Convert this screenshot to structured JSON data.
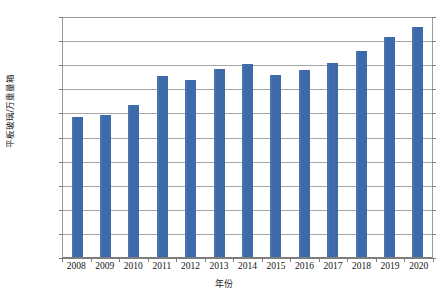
{
  "chart_data": {
    "type": "bar",
    "title": "",
    "xlabel": "年份",
    "ylabel": "平板玻璃/万重量箱",
    "categories": [
      "2008",
      "2009",
      "2010",
      "2011",
      "2012",
      "2013",
      "2014",
      "2015",
      "2016",
      "2017",
      "2018",
      "2019",
      "2020"
    ],
    "values": [
      58000,
      59000,
      63000,
      75000,
      73500,
      78000,
      80000,
      75500,
      77500,
      80500,
      85500,
      91500,
      95500
    ],
    "ylim": [
      0,
      100000
    ],
    "yticks": [
      0,
      10000,
      20000,
      30000,
      40000,
      50000,
      60000,
      70000,
      80000,
      90000,
      100000
    ],
    "ytick_labels": [
      "0",
      "10000",
      "20000",
      "30000",
      "40000",
      "50000",
      "60000",
      "70000",
      "80000",
      "90000",
      "100000"
    ],
    "grid": true,
    "legend": false,
    "legend_position": "none",
    "series": [
      {
        "name": "平板玻璃产量",
        "color": "#3D6AA8",
        "values": [
          58000,
          59000,
          63000,
          75000,
          73500,
          78000,
          80000,
          75500,
          77500,
          80500,
          85500,
          91500,
          95500
        ]
      }
    ]
  },
  "colors": {
    "bar": "#3D6AA8",
    "bar_highlight": "#4974b0",
    "gridline": "#a6a6a6",
    "axis": "#7d7d7d",
    "text": "#141414",
    "background": "#ffffff"
  }
}
